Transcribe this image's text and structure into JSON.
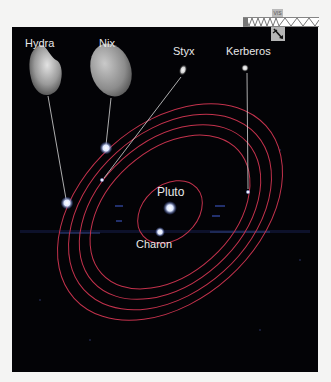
{
  "diagram": {
    "colors": {
      "background": "#030306",
      "page": "#f4f4f3",
      "orbit": "#c2324c",
      "pointer_line": "#d8d8d8",
      "label": "#e8e8e8",
      "star_glow": "#dfe8ff"
    },
    "labels": {
      "hydra": "Hydra",
      "nix": "Nix",
      "styx": "Styx",
      "kerberos": "Kerberos",
      "pluto": "Pluto",
      "charon": "Charon"
    },
    "badge": {
      "text": "VIS",
      "icon": "space-probe-icon"
    }
  }
}
